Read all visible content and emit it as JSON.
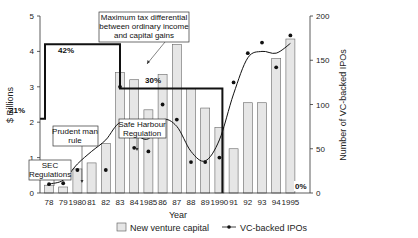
{
  "chart_data": {
    "type": "bar+line",
    "title": "",
    "xlabel": "Year",
    "ylabel_left": "$ Billions",
    "ylabel_right": "Number of VC-backed IPOs",
    "ylim_left": [
      0,
      5
    ],
    "ylim_right": [
      0,
      200
    ],
    "left_ticks": [
      "0",
      "1",
      "2",
      "3",
      "4",
      "5"
    ],
    "right_ticks": [
      "0",
      "50",
      "100",
      "150",
      "200"
    ],
    "categories": [
      "78",
      "79",
      "1980",
      "81",
      "82",
      "83",
      "84",
      "1985",
      "86",
      "87",
      "88",
      "89",
      "1990",
      "91",
      "92",
      "93",
      "94",
      "1995"
    ],
    "series": [
      {
        "name": "New venture capital",
        "type": "bar",
        "axis": "left",
        "values": [
          0.22,
          0.17,
          0.68,
          0.85,
          1.4,
          3.4,
          3.2,
          2.35,
          3.35,
          4.2,
          2.95,
          2.4,
          1.85,
          1.25,
          2.55,
          2.55,
          3.8,
          4.35
        ]
      },
      {
        "name": "VC-backed IPOs",
        "type": "line",
        "axis": "right",
        "values": [
          10,
          11,
          26,
          68,
          26,
          120,
          51,
          47,
          100,
          83,
          35,
          35,
          40,
          125,
          158,
          170,
          142,
          178
        ]
      }
    ],
    "tax_rate_step": {
      "label": "Maximum tax differential between ordinary income and capital gains",
      "segments": [
        {
          "from": "start",
          "to": "78",
          "rate": "21%",
          "level": 2.1
        },
        {
          "from": "78",
          "to": "83",
          "rate": "42%",
          "level": 4.2
        },
        {
          "from": "83",
          "to": "1990",
          "rate": "30%",
          "level": 2.95
        },
        {
          "from": "1990",
          "to": "1995",
          "rate": "0%",
          "level": 0
        }
      ]
    },
    "annotations": [
      {
        "text": "SEC Regulations",
        "at": "78"
      },
      {
        "text": "Prudent man rule",
        "at": "1980"
      },
      {
        "text": "Safe Harbour Regulation",
        "at": "83"
      },
      {
        "text": "Maximum tax differential between ordinary income and capital gains",
        "at": "83"
      }
    ],
    "legend": [
      "New venture capital",
      "VC-backed IPOs"
    ],
    "legend_position": "bottom",
    "grid": false
  },
  "labels": {
    "ylabel_left": "$ Billions",
    "ylabel_right": "Number of VC-backed IPOs",
    "xlabel": "Year",
    "legend_bar": "New venture capital",
    "legend_line": "VC-backed IPOs",
    "ann_tax_1": "Maximum tax differential",
    "ann_tax_2": "between ordinary income",
    "ann_tax_3": "and capital gains",
    "ann_sec_1": "SEC",
    "ann_sec_2": "Regulations",
    "ann_prudent_1": "Prudent man",
    "ann_prudent_2": "rule",
    "ann_safe_1": "Safe Harbour",
    "ann_safe_2": "Regulation",
    "pct_21": "21%",
    "pct_42": "42%",
    "pct_30": "30%",
    "pct_0": "0%"
  }
}
